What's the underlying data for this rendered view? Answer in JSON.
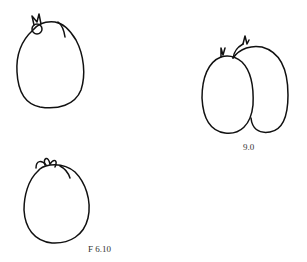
{
  "figure": {
    "labels": {
      "right_pair": "9.0",
      "bottom_left": "F 6.10"
    },
    "stroke_color": "#111111",
    "background": "#ffffff",
    "items": [
      {
        "name": "fruit-top-left",
        "description": "single rounded fruit with leafy stem"
      },
      {
        "name": "fruit-pair-right",
        "description": "two overlapping oval fruits with stems"
      },
      {
        "name": "fruit-bottom-left",
        "description": "single rounded fruit with leafy stem"
      }
    ]
  }
}
